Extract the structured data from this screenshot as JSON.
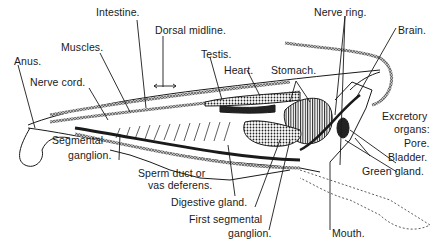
{
  "diagram": {
    "labels": {
      "intestine": "Intestine.",
      "dorsal_midline": "Dorsal midline.",
      "nerve_ring": "Nerve ring.",
      "brain": "Brain.",
      "muscles": "Muscles.",
      "testis": "Testis.",
      "anus": "Anus.",
      "heart": "Heart.",
      "stomach": "Stomach.",
      "nerve_cord": "Nerve cord.",
      "excretory_organs": "Excretory",
      "excretory_organs_2": "organs:",
      "pore": "Pore.",
      "bladder": "Bladder.",
      "green_gland": "Green gland.",
      "segmental_ganglion_1": "Segmental",
      "segmental_ganglion_2": "ganglion.",
      "sperm_duct_1": "Sperm duct or",
      "sperm_duct_2": "vas deferens.",
      "digestive_gland": "Digestive gland.",
      "first_segmental_1": "First segmental",
      "first_segmental_2": "ganglion.",
      "mouth": "Mouth."
    },
    "colors": {
      "ink": "#1a1a1a",
      "background": "#ffffff"
    }
  }
}
